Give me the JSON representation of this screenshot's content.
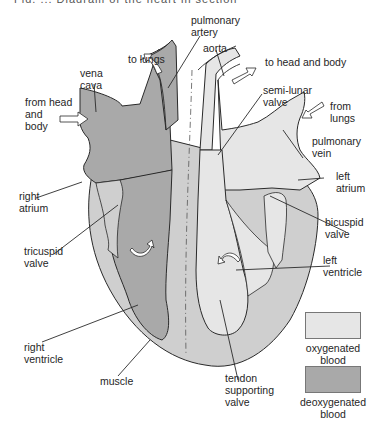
{
  "caption": {
    "text": "Fig. ... Diagram of the heart in section (cropped)"
  },
  "diagram": {
    "labels": {
      "pulmonary_artery": "pulmonary\nartery",
      "aorta": "aorta",
      "to_lungs": "to lungs",
      "to_head_and_body": "to head and body",
      "vena_cava": "vena\ncava",
      "from_head_and_body": "from head\nand\nbody",
      "semi_lunar_valve": "semi-lunar\nvalve",
      "from_lungs": "from\nlungs",
      "pulmonary_vein": "pulmonary\nvein",
      "right_atrium": "right\natrium",
      "left_atrium": "left\natrium",
      "tricuspid_valve": "tricuspid\nvalve",
      "bicuspid_valve": "bicuspid\nvalve",
      "left_ventricle": "left\nventricle",
      "right_ventricle": "right\nventricle",
      "muscle": "muscle",
      "tendon_supporting_valve": "tendon\nsupporting\nvalve"
    }
  },
  "legend": {
    "items": [
      {
        "label": "oxygenated\nblood",
        "color": "#e6e6e6"
      },
      {
        "label": "deoxygenated\nblood",
        "color": "#a9a9a9"
      }
    ]
  },
  "colors": {
    "muscle": "#cfcfcf",
    "oxygenated": "#e6e6e6",
    "deoxygenated": "#a9a9a9",
    "outline": "#2a2a2a",
    "arrow_fill": "#ffffff"
  }
}
